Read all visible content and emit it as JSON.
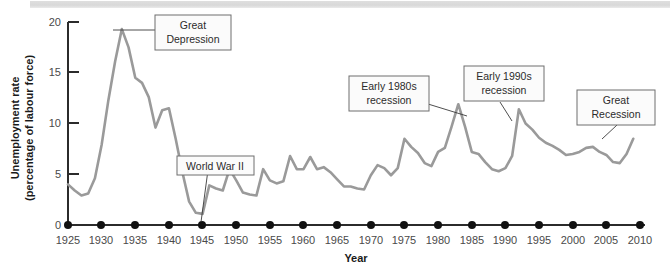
{
  "figure": {
    "background_color": "#ffffff",
    "line_color": "#9a9a9a",
    "axis_color": "#2b2b2b"
  },
  "axes": {
    "y_title_line1": "Unemployment rate",
    "y_title_line2": "(percentage of labour force)",
    "x_title": "Year",
    "y_ticks": [
      "0",
      "5",
      "10",
      "15",
      "20"
    ],
    "x_ticks": [
      "1925",
      "1930",
      "1935",
      "1940",
      "1945",
      "1950",
      "1955",
      "1960",
      "1965",
      "1970",
      "1975",
      "1980",
      "1985",
      "1990",
      "1995",
      "2000",
      "2005",
      "2010"
    ]
  },
  "annotations": [
    {
      "id": "great-depression",
      "line1": "Great",
      "line2": "Depression"
    },
    {
      "id": "world-war-ii",
      "line1": "World War II",
      "line2": ""
    },
    {
      "id": "early-1980s-recession",
      "line1": "Early 1980s",
      "line2": "recession"
    },
    {
      "id": "early-1990s-recession",
      "line1": "Early 1990s",
      "line2": "recession"
    },
    {
      "id": "great-recession",
      "line1": "Great",
      "line2": "Recession"
    }
  ],
  "chart_data": {
    "type": "line",
    "title": "",
    "xlabel": "Year",
    "ylabel": "Unemployment rate (percentage of labour force)",
    "xlim": [
      1925,
      2010
    ],
    "ylim": [
      0,
      20
    ],
    "grid": false,
    "legend": "none",
    "x": [
      1925,
      1926,
      1927,
      1928,
      1929,
      1930,
      1931,
      1932,
      1933,
      1934,
      1935,
      1936,
      1937,
      1938,
      1939,
      1940,
      1941,
      1942,
      1943,
      1944,
      1945,
      1946,
      1947,
      1948,
      1949,
      1950,
      1951,
      1952,
      1953,
      1954,
      1955,
      1956,
      1957,
      1958,
      1959,
      1960,
      1961,
      1962,
      1963,
      1964,
      1965,
      1966,
      1967,
      1968,
      1969,
      1970,
      1971,
      1972,
      1973,
      1974,
      1975,
      1976,
      1977,
      1978,
      1979,
      1980,
      1981,
      1982,
      1983,
      1984,
      1985,
      1986,
      1987,
      1988,
      1989,
      1990,
      1991,
      1992,
      1993,
      1994,
      1995,
      1996,
      1997,
      1998,
      1999,
      2000,
      2001,
      2002,
      2003,
      2004,
      2005,
      2006,
      2007,
      2008,
      2009
    ],
    "y": [
      4.0,
      3.4,
      2.9,
      3.1,
      4.6,
      7.9,
      12.3,
      16.1,
      19.3,
      17.5,
      14.5,
      14.0,
      12.6,
      9.6,
      11.3,
      11.5,
      8.5,
      5.2,
      2.3,
      1.2,
      1.1,
      3.9,
      3.6,
      3.4,
      5.5,
      4.4,
      3.2,
      3.0,
      2.9,
      5.5,
      4.4,
      4.1,
      4.3,
      6.8,
      5.5,
      5.5,
      6.7,
      5.5,
      5.7,
      5.2,
      4.5,
      3.8,
      3.8,
      3.6,
      3.5,
      4.9,
      5.9,
      5.6,
      4.9,
      5.6,
      8.5,
      7.7,
      7.1,
      6.1,
      5.8,
      7.2,
      7.6,
      9.7,
      11.9,
      9.7,
      7.2,
      7.0,
      6.2,
      5.5,
      5.3,
      5.6,
      6.8,
      11.4,
      10.0,
      9.4,
      8.6,
      8.1,
      7.8,
      7.4,
      6.9,
      7.0,
      7.2,
      7.6,
      7.7,
      7.2,
      6.9,
      6.2,
      6.1,
      7.0,
      8.5
    ],
    "annotations": [
      {
        "label": "Great Depression",
        "at_year": 1933,
        "at_value": 19.3
      },
      {
        "label": "World War II",
        "at_year": 1944,
        "at_value": 1.2
      },
      {
        "label": "Early 1980s recession",
        "at_year": 1983,
        "at_value": 11.9
      },
      {
        "label": "Early 1990s recession",
        "at_year": 1992,
        "at_value": 11.4
      },
      {
        "label": "Great Recession",
        "at_year": 2008,
        "at_value": 7.0
      }
    ]
  }
}
